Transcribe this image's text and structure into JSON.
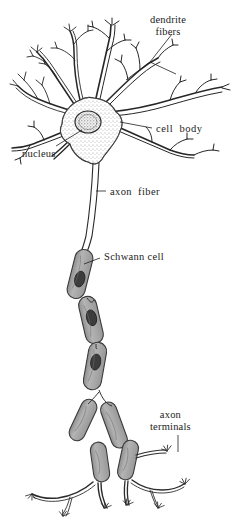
{
  "figure": {
    "background_color": "#ffffff",
    "ink_color": "#1b1b1b",
    "myelin_fill_color": "#ababab",
    "nucleus_fill_color": "#3d3d3d",
    "soma_fill_color": "#e8e8e8",
    "style": "black-and-white stippled pen-and-ink scientific illustration"
  },
  "labels": {
    "dendrite_fibers_line1": "dendrite",
    "dendrite_fibers_line2": "fibers",
    "cell_body": "cell  body",
    "nucleus": "nucleus",
    "axon_fiber": "axon  fiber",
    "schwann_cell": "Schwann cell",
    "axon_terminals_line1": "axon",
    "axon_terminals_line2": "terminals"
  },
  "parts": [
    {
      "name": "dendrite-fibers",
      "label": "dendrite fibers",
      "description": "branching tapered processes radiating from the top of the cell body"
    },
    {
      "name": "cell-body",
      "label": "cell body",
      "description": "stippled star-shaped soma"
    },
    {
      "name": "nucleus",
      "label": "nucleus",
      "description": "oval stippled nucleus inside the soma"
    },
    {
      "name": "axon-fiber",
      "label": "axon fiber",
      "description": "long double-line fiber descending from the soma"
    },
    {
      "name": "schwann-cell",
      "label": "Schwann cell",
      "description": "gray myelin segments with dark nuclei along the axon"
    },
    {
      "name": "axon-terminals",
      "label": "axon terminals",
      "description": "fine forked endings at the bottom of the axon branches"
    }
  ]
}
